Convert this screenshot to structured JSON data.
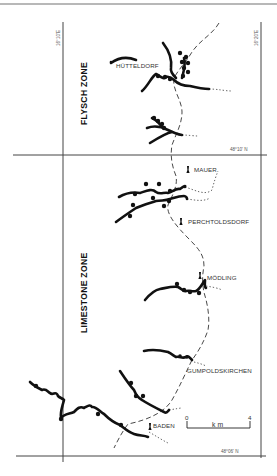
{
  "map": {
    "zones": {
      "flysch": "FLYSCH ZONE",
      "limestone": "LIMESTONE ZONE"
    },
    "coordinates": {
      "lon_left": "16°10'E",
      "lon_right": "16°20'E",
      "lat_middle": "48°10' N",
      "lat_bottom": "48°06' N"
    },
    "places": [
      {
        "name": "HÜTTELDORF"
      },
      {
        "name": "MAUER"
      },
      {
        "name": "PERCHTOLDSDORF"
      },
      {
        "name": "MÖDLING"
      },
      {
        "name": "GUMPOLDSKIRCHEN"
      },
      {
        "name": "BADEN"
      }
    ],
    "scale": {
      "start": "0",
      "end": "4",
      "unit": "km"
    },
    "colors": {
      "ink": "#111111",
      "frame": "#444444",
      "background": "#ffffff"
    }
  }
}
